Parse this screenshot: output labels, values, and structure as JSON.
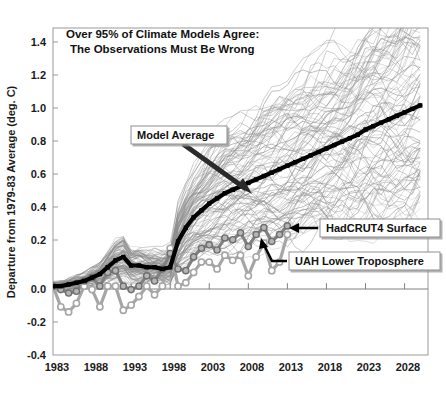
{
  "chart_data": {
    "type": "line",
    "title": "Over 95% of Climate Models Agree:\nThe Observations Must Be Wrong",
    "title_line1": "Over 95% of Climate Models Agree:",
    "title_line2": "The Observations Must Be Wrong",
    "xlabel": "",
    "ylabel": "Departure from 1979-83 Average (deg. C)",
    "xlim": [
      1983,
      2031
    ],
    "ylim": [
      -0.4,
      1.5
    ],
    "xticks": [
      1983,
      1988,
      1993,
      1998,
      2003,
      2008,
      2013,
      2018,
      2023,
      2028
    ],
    "xtick_labels": [
      "1983",
      "1988",
      "1993",
      "1998",
      "2003",
      "2008",
      "2013",
      "2018",
      "2023",
      "2028"
    ],
    "yticks": [
      1.4,
      1.2,
      1.0,
      0.8,
      0.6,
      0.4,
      0.2,
      0.0,
      -0.2,
      -0.4
    ],
    "ytick_labels": [
      "1.4",
      "1.2",
      "1.0",
      "0.8",
      "0.6",
      "0.4",
      "0.2",
      "0.0",
      "-0.2",
      "-0.4"
    ],
    "grid": false,
    "zero_line": 0.0,
    "legend_position": "inline-callouts",
    "annotations": [
      {
        "id": "model-average",
        "label": "Model Average",
        "box_x": 131,
        "box_y": 126,
        "arrow_to_x": 249,
        "arrow_to_y": 192
      },
      {
        "id": "hadcrut4",
        "label": "HadCRUT4 Surface",
        "box_x": 320,
        "box_y": 219,
        "arrow_to_x": 292,
        "arrow_to_y": 228
      },
      {
        "id": "uah",
        "label": "UAH Lower Troposphere",
        "box_x": 289,
        "box_y": 252,
        "arrow_to_x": 263,
        "arrow_to_y": 240
      }
    ],
    "colors": {
      "model_average": "#000000",
      "model_spread": "#8c8c8c",
      "hadcrut4": "#808080",
      "uah": "#a6a6a6",
      "axis": "#808080",
      "text": "#111111"
    },
    "series": [
      {
        "name": "Model Average",
        "style": "thick-black-line-with-dots",
        "x": [
          1983,
          1984,
          1985,
          1986,
          1987,
          1988,
          1989,
          1990,
          1991,
          1992,
          1993,
          1994,
          1995,
          1996,
          1997,
          1998,
          1999,
          2000,
          2001,
          2002,
          2003,
          2004,
          2005,
          2006,
          2007,
          2008,
          2009,
          2010,
          2011,
          2012,
          2013,
          2014,
          2015,
          2016,
          2017,
          2018,
          2019,
          2020,
          2021,
          2022,
          2023,
          2024,
          2025,
          2026,
          2027,
          2028,
          2029,
          2030
        ],
        "values": [
          0.0,
          0.0,
          0.01,
          0.02,
          0.03,
          0.05,
          0.07,
          0.11,
          0.15,
          0.17,
          0.12,
          0.12,
          0.11,
          0.11,
          0.1,
          0.11,
          0.26,
          0.34,
          0.4,
          0.44,
          0.48,
          0.51,
          0.54,
          0.56,
          0.58,
          0.6,
          0.62,
          0.64,
          0.66,
          0.68,
          0.7,
          0.72,
          0.74,
          0.76,
          0.78,
          0.8,
          0.82,
          0.84,
          0.86,
          0.88,
          0.91,
          0.93,
          0.95,
          0.97,
          0.99,
          1.01,
          1.03,
          1.05
        ]
      },
      {
        "name": "HadCRUT4 Surface",
        "style": "gray-line-with-filled-circles",
        "x": [
          1983,
          1984,
          1985,
          1986,
          1987,
          1988,
          1989,
          1990,
          1991,
          1992,
          1993,
          1994,
          1995,
          1996,
          1997,
          1998,
          1999,
          2000,
          2001,
          2002,
          2003,
          2004,
          2005,
          2006,
          2007,
          2008,
          2009,
          2010,
          2011,
          2012,
          2013
        ],
        "values": [
          0.0,
          -0.02,
          -0.04,
          -0.03,
          0.03,
          0.05,
          0.0,
          0.08,
          0.09,
          0.0,
          -0.02,
          0.0,
          0.06,
          0.03,
          0.1,
          0.19,
          0.1,
          0.09,
          0.17,
          0.22,
          0.24,
          0.21,
          0.28,
          0.27,
          0.31,
          0.23,
          0.3,
          0.34,
          0.26,
          0.3,
          0.35
        ]
      },
      {
        "name": "UAH Lower Troposphere",
        "style": "light-gray-line-with-hollow-circles",
        "x": [
          1983,
          1984,
          1985,
          1986,
          1987,
          1988,
          1989,
          1990,
          1991,
          1992,
          1993,
          1994,
          1995,
          1996,
          1997,
          1998,
          1999,
          2000,
          2001,
          2002,
          2003,
          2004,
          2005,
          2006,
          2007,
          2008,
          2009,
          2010,
          2011,
          2012,
          2013
        ],
        "values": [
          0.0,
          -0.12,
          -0.15,
          -0.1,
          0.0,
          -0.02,
          -0.12,
          0.0,
          0.0,
          -0.14,
          -0.11,
          -0.06,
          0.0,
          -0.05,
          0.0,
          0.22,
          0.0,
          0.02,
          0.08,
          0.14,
          0.14,
          0.1,
          0.18,
          0.15,
          0.18,
          0.06,
          0.17,
          0.25,
          0.09,
          0.14,
          0.3
        ]
      }
    ],
    "model_spread_description": "Approximately 100 individual CMIP model run trajectories drawn as thin gray spaghetti lines fanning out from 0.0 at 1983 to a range of roughly 0.5 to 1.5 deg C by 2030"
  },
  "figure": {
    "background": "#ffffff",
    "plot_left": 53,
    "plot_right": 428,
    "plot_top": 28,
    "plot_bottom": 355
  }
}
